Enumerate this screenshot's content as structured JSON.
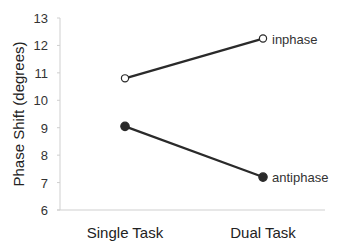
{
  "chart_data": {
    "type": "line",
    "title": "",
    "xlabel": "",
    "ylabel": "Phase Shift (degrees)",
    "categories": [
      "Single Task",
      "Dual Task"
    ],
    "series": [
      {
        "name": "inphase",
        "marker": "open-circle",
        "values": [
          10.8,
          12.25
        ]
      },
      {
        "name": "antiphase",
        "marker": "filled-circle",
        "values": [
          9.05,
          7.2
        ]
      }
    ],
    "ylim": [
      6,
      13
    ],
    "yticks": [
      "6",
      "7",
      "8",
      "9",
      "10",
      "11",
      "12",
      "13"
    ],
    "grid": false,
    "legend": "direct labels at line ends"
  },
  "colors": {
    "line": "#2a2a2a",
    "axis": "#cfcfcf",
    "text": "#222222"
  }
}
